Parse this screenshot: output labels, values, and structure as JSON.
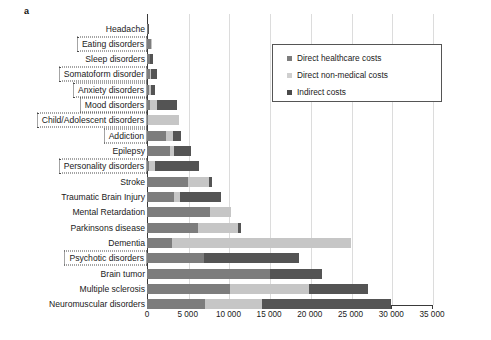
{
  "panel": {
    "letter": "a"
  },
  "legend": {
    "position": "top-right-inside",
    "items": [
      {
        "label": "Direct healthcare costs",
        "color": "#7d7d7d",
        "key": "direct_healthcare"
      },
      {
        "label": "Direct non-medical costs",
        "color": "#cfcfcf",
        "key": "direct_non_medical"
      },
      {
        "label": "Indirect costs",
        "color": "#4a4a4a",
        "key": "indirect"
      }
    ]
  },
  "axis": {
    "ticks": [
      "0",
      "5 000",
      "10 000",
      "15 000",
      "20 000",
      "25 000",
      "30 000",
      "35 000"
    ],
    "tick_values": [
      0,
      5000,
      10000,
      15000,
      20000,
      25000,
      30000,
      35000
    ],
    "xlim": [
      0,
      35000
    ],
    "grid": true
  },
  "chart_data": {
    "type": "bar",
    "orientation": "horizontal",
    "stacked": true,
    "title": "",
    "xlabel": "",
    "ylabel": "",
    "xlim": [
      0,
      35000
    ],
    "grid": true,
    "legend_position": "top-right-inside",
    "categories": [
      "Headache",
      "Eating disorders",
      "Sleep disorders",
      "Somatoform disorder",
      "Anxiety disorders",
      "Mood disorders",
      "Child/Adolescent disorders",
      "Addiction",
      "Epilepsy",
      "Personality disorders",
      "Stroke",
      "Traumatic Brain Injury",
      "Mental Retardation",
      "Parkinsons disease",
      "Dementia",
      "Psychotic disorders",
      "Brain tumor",
      "Multiple sclerosis",
      "Neuromuscular disorders"
    ],
    "highlighted_categories": [
      "Eating disorders",
      "Somatoform disorder",
      "Anxiety disorders",
      "Mood disorders",
      "Child/Adolescent disorders",
      "Addiction",
      "Personality disorders",
      "Psychotic disorders"
    ],
    "series": [
      {
        "name": "Direct healthcare costs",
        "color": "#7d7d7d",
        "values": [
          100,
          500,
          400,
          350,
          300,
          400,
          150,
          2300,
          2800,
          250,
          5000,
          3300,
          7700,
          6300,
          3100,
          7000,
          15100,
          10200,
          7100
        ]
      },
      {
        "name": "Direct non-medical costs",
        "color": "#cfcfcf",
        "values": [
          0,
          100,
          0,
          150,
          200,
          800,
          3750,
          900,
          500,
          700,
          2600,
          750,
          2600,
          4900,
          22000,
          0,
          0,
          9700,
          7000
        ]
      },
      {
        "name": "Indirect costs",
        "color": "#4a4a4a",
        "values": [
          100,
          0,
          300,
          700,
          500,
          2500,
          0,
          1000,
          2100,
          5400,
          400,
          5000,
          0,
          400,
          0,
          11700,
          6400,
          7200,
          15900
        ]
      }
    ],
    "totals": [
      200,
      600,
      700,
      1200,
      1000,
      3700,
      3900,
      4200,
      5400,
      6350,
      8000,
      9050,
      10300,
      11600,
      25100,
      18700,
      21500,
      27100,
      30000
    ]
  }
}
